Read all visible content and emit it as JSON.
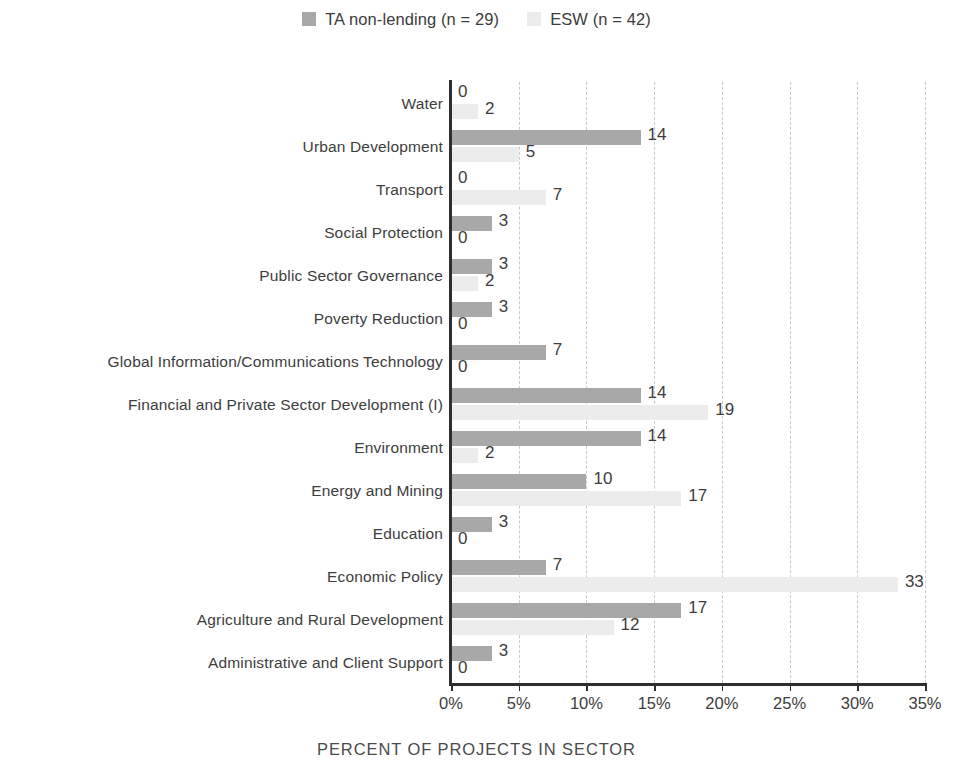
{
  "legend": {
    "entries": [
      {
        "label": "TA non-lending (n = 29)",
        "color": "#a8a8a8",
        "key": "ta"
      },
      {
        "label": "ESW (n = 42)",
        "color": "#ececec",
        "key": "esw"
      }
    ]
  },
  "axis": {
    "title": "PERCENT OF PROJECTS IN SECTOR",
    "ticks": [
      "0%",
      "5%",
      "10%",
      "15%",
      "20%",
      "25%",
      "30%",
      "35%"
    ]
  },
  "colors": {
    "ta": "#a8a8a8",
    "esw": "#ececec",
    "text": "#3d3d3d",
    "axis": "#2e2e2e",
    "grid": "#c9c9c9"
  },
  "chart_data": {
    "type": "bar",
    "orientation": "horizontal",
    "title": "",
    "xlabel": "PERCENT OF PROJECTS IN SECTOR",
    "ylabel": "",
    "xlim": [
      0,
      35
    ],
    "xticks": [
      0,
      5,
      10,
      15,
      20,
      25,
      30,
      35
    ],
    "xtick_labels": [
      "0%",
      "5%",
      "10%",
      "15%",
      "20%",
      "25%",
      "30%",
      "35%"
    ],
    "grid": "vertical-dashed",
    "legend_position": "top-center",
    "value_labels": true,
    "categories": [
      "Water",
      "Urban Development",
      "Transport",
      "Social Protection",
      "Public Sector Governance",
      "Poverty Reduction",
      "Global Information/Communications Technology",
      "Financial and Private Sector Development (I)",
      "Environment",
      "Energy and Mining",
      "Education",
      "Economic Policy",
      "Agriculture and Rural Development",
      "Administrative and Client Support"
    ],
    "series": [
      {
        "name": "TA non-lending (n = 29)",
        "color": "#a8a8a8",
        "values": [
          0,
          14,
          0,
          3,
          3,
          3,
          7,
          14,
          14,
          10,
          3,
          7,
          17,
          3
        ],
        "labels": [
          "0",
          "14",
          "0",
          "3",
          "3",
          "3",
          "7",
          "14",
          "14",
          "10",
          "3",
          "7",
          "17",
          "3"
        ]
      },
      {
        "name": "ESW (n = 42)",
        "color": "#ececec",
        "values": [
          2,
          5,
          7,
          0,
          2,
          0,
          0,
          19,
          2,
          17,
          0,
          33,
          12,
          0
        ],
        "labels": [
          "2",
          "5",
          "7",
          "0",
          "2",
          "0",
          "0",
          "19",
          "2",
          "17",
          "0",
          "33",
          "12",
          "0"
        ]
      }
    ]
  }
}
